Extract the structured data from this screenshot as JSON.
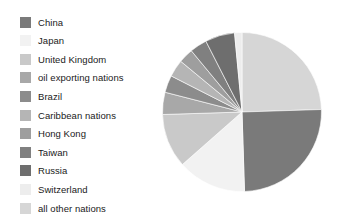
{
  "chart_data": {
    "type": "pie",
    "title": "",
    "legend_position": "left",
    "grid": false,
    "categories": [
      "China",
      "Japan",
      "United Kingdom",
      "oil exporting nations",
      "Brazil",
      "Caribbean nations",
      "Hong Kong",
      "Taiwan",
      "Russia",
      "Switzerland",
      "all other nations"
    ],
    "values": [
      25,
      14,
      11,
      4.5,
      3.5,
      3.5,
      3,
      3.5,
      6,
      1.5,
      24.5
    ],
    "colors": [
      "#7a7a7a",
      "#f2f2f2",
      "#c9c9c9",
      "#a8a8a8",
      "#8c8c8c",
      "#b5b5b5",
      "#9e9e9e",
      "#808080",
      "#6e6e6e",
      "#ededed",
      "#d6d6d6"
    ],
    "start_angle_deg": 0,
    "direction": "clockwise",
    "slices": [
      {
        "label": "all other nations",
        "value": 24.5,
        "color": "#d6d6d6",
        "start_deg": 0,
        "end_deg": 88.2
      },
      {
        "label": "China",
        "value": 25.0,
        "color": "#7a7a7a",
        "start_deg": 88.2,
        "end_deg": 178.2
      },
      {
        "label": "Japan",
        "value": 14.0,
        "color": "#f2f2f2",
        "start_deg": 178.2,
        "end_deg": 228.6
      },
      {
        "label": "United Kingdom",
        "value": 11.0,
        "color": "#c9c9c9",
        "start_deg": 228.6,
        "end_deg": 268.2
      },
      {
        "label": "oil exporting nations",
        "value": 4.5,
        "color": "#a8a8a8",
        "start_deg": 268.2,
        "end_deg": 284.4
      },
      {
        "label": "Brazil",
        "value": 3.5,
        "color": "#8c8c8c",
        "start_deg": 284.4,
        "end_deg": 297.0
      },
      {
        "label": "Caribbean nations",
        "value": 3.5,
        "color": "#b5b5b5",
        "start_deg": 297.0,
        "end_deg": 309.6
      },
      {
        "label": "Hong Kong",
        "value": 3.0,
        "color": "#9e9e9e",
        "start_deg": 309.6,
        "end_deg": 320.4
      },
      {
        "label": "Taiwan",
        "value": 3.5,
        "color": "#808080",
        "start_deg": 320.4,
        "end_deg": 333.0
      },
      {
        "label": "Russia",
        "value": 6.0,
        "color": "#6e6e6e",
        "start_deg": 333.0,
        "end_deg": 354.6
      },
      {
        "label": "Switzerland",
        "value": 1.5,
        "color": "#ededed",
        "start_deg": 354.6,
        "end_deg": 360.0
      }
    ]
  },
  "legend": {
    "items": [
      {
        "label": "China",
        "color": "#7a7a7a"
      },
      {
        "label": "Japan",
        "color": "#f2f2f2"
      },
      {
        "label": "United Kingdom",
        "color": "#c9c9c9"
      },
      {
        "label": "oil exporting nations",
        "color": "#a8a8a8"
      },
      {
        "label": "Brazil",
        "color": "#8c8c8c"
      },
      {
        "label": "Caribbean nations",
        "color": "#b5b5b5"
      },
      {
        "label": "Hong Kong",
        "color": "#9e9e9e"
      },
      {
        "label": "Taiwan",
        "color": "#808080"
      },
      {
        "label": "Russia",
        "color": "#6e6e6e"
      },
      {
        "label": "Switzerland",
        "color": "#ededed"
      },
      {
        "label": "all other nations",
        "color": "#d6d6d6"
      }
    ]
  }
}
